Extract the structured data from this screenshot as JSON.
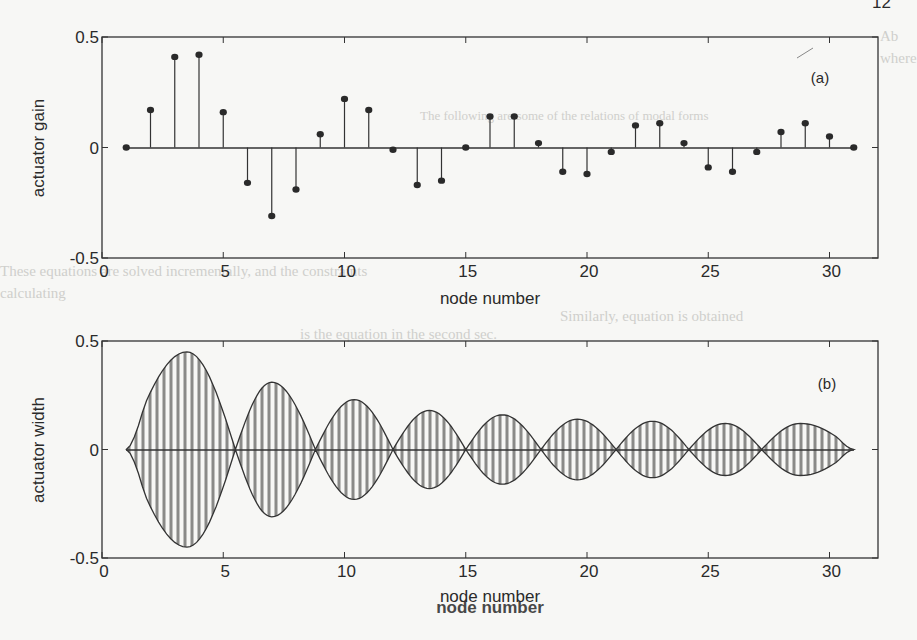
{
  "page": {
    "page_number_fragment": "12"
  },
  "ghost_text": [
    "Ab",
    "where",
    "The following are some of the relations of modal forms",
    "These equations are solved incrementally, and the constraints",
    "calculating",
    "Similarly, equation is obtained",
    "is the equation in the second sec."
  ],
  "chart_data": [
    {
      "id": "a",
      "type": "stem",
      "panel_label": "(a)",
      "title": "",
      "xlabel": "node number",
      "ylabel": "actuator gain",
      "xlim": [
        0,
        32
      ],
      "ylim": [
        -0.5,
        0.5
      ],
      "xticks": [
        0,
        5,
        10,
        15,
        20,
        25,
        30
      ],
      "yticks": [
        -0.5,
        0,
        0.5
      ],
      "xtick_labels": [
        "0",
        "5",
        "10",
        "15",
        "20",
        "25",
        "30"
      ],
      "ytick_labels": [
        "-0.5",
        "0",
        "0.5"
      ],
      "grid": false,
      "x": [
        1,
        2,
        3,
        4,
        5,
        6,
        7,
        8,
        9,
        10,
        11,
        12,
        13,
        14,
        15,
        16,
        17,
        18,
        19,
        20,
        21,
        22,
        23,
        24,
        25,
        26,
        27,
        28,
        29,
        30,
        31
      ],
      "values": [
        0.0,
        0.17,
        0.41,
        0.42,
        0.16,
        -0.16,
        -0.31,
        -0.19,
        0.06,
        0.22,
        0.17,
        -0.01,
        -0.17,
        -0.15,
        0.0,
        0.14,
        0.14,
        0.02,
        -0.11,
        -0.12,
        -0.02,
        0.1,
        0.11,
        0.02,
        -0.09,
        -0.11,
        -0.02,
        0.07,
        0.11,
        0.05,
        0.0
      ]
    },
    {
      "id": "b",
      "type": "area",
      "panel_label": "(b)",
      "title": "",
      "xlabel": "node number",
      "ylabel": "actuator width",
      "xlim": [
        0,
        32
      ],
      "ylim": [
        -0.5,
        0.5
      ],
      "xticks": [
        0,
        5,
        10,
        15,
        20,
        25,
        30
      ],
      "yticks": [
        -0.5,
        0,
        0.5
      ],
      "xtick_labels": [
        "0",
        "5",
        "10",
        "15",
        "20",
        "25",
        "30"
      ],
      "ytick_labels": [
        "-0.5",
        "0",
        "0.5"
      ],
      "grid": false,
      "fill": "vertical-hatch",
      "symmetric": true,
      "zero_crossings": [
        1.0,
        5.5,
        8.8,
        12.0,
        15.0,
        18.1,
        21.2,
        24.2,
        27.2,
        31.0
      ],
      "lobe_peaks": [
        {
          "x": 3.5,
          "y": 0.45
        },
        {
          "x": 7.0,
          "y": 0.31
        },
        {
          "x": 10.4,
          "y": 0.23
        },
        {
          "x": 13.5,
          "y": 0.18
        },
        {
          "x": 16.5,
          "y": 0.16
        },
        {
          "x": 19.6,
          "y": 0.14
        },
        {
          "x": 22.7,
          "y": 0.13
        },
        {
          "x": 25.7,
          "y": 0.12
        },
        {
          "x": 28.8,
          "y": 0.12
        }
      ]
    }
  ]
}
